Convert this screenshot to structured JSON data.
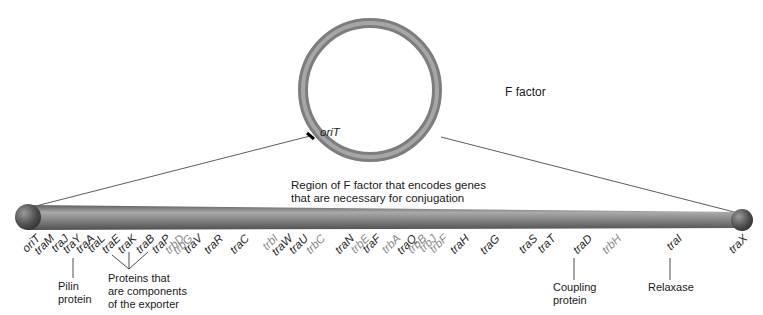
{
  "plasmid": {
    "name": "F factor",
    "origin_label": "oriT"
  },
  "region_caption": "Region of F factor that encodes genes that are necessary for conjugation",
  "region_caption_lines": [
    "Region of F factor that encodes genes",
    "that are necessary for conjugation"
  ],
  "genes": [
    {
      "name": "oriT",
      "x": 28,
      "type": "tra"
    },
    {
      "name": "traM",
      "x": 42,
      "type": "tra"
    },
    {
      "name": "traJ",
      "x": 56,
      "type": "tra"
    },
    {
      "name": "traY",
      "x": 69,
      "type": "tra"
    },
    {
      "name": "traA",
      "x": 82,
      "type": "tra"
    },
    {
      "name": "traL",
      "x": 93,
      "type": "tra"
    },
    {
      "name": "traE",
      "x": 108,
      "type": "tra"
    },
    {
      "name": "traK",
      "x": 124,
      "type": "tra"
    },
    {
      "name": "traB",
      "x": 142,
      "type": "tra"
    },
    {
      "name": "traP",
      "x": 158,
      "type": "tra"
    },
    {
      "name": "trbD",
      "x": 172,
      "type": "trb"
    },
    {
      "name": "trbG",
      "x": 180,
      "type": "trb"
    },
    {
      "name": "traV",
      "x": 190,
      "type": "tra"
    },
    {
      "name": "traR",
      "x": 211,
      "type": "tra"
    },
    {
      "name": "traC",
      "x": 237,
      "type": "tra"
    },
    {
      "name": "trbI",
      "x": 266,
      "type": "trb"
    },
    {
      "name": "traW",
      "x": 280,
      "type": "tra"
    },
    {
      "name": "traU",
      "x": 296,
      "type": "tra"
    },
    {
      "name": "trbC",
      "x": 313,
      "type": "trb"
    },
    {
      "name": "traN",
      "x": 342,
      "type": "tra"
    },
    {
      "name": "trbE",
      "x": 357,
      "type": "trb"
    },
    {
      "name": "traF",
      "x": 368,
      "type": "tra"
    },
    {
      "name": "trbA",
      "x": 388,
      "type": "trb"
    },
    {
      "name": "traQ",
      "x": 404,
      "type": "tra"
    },
    {
      "name": "trbB",
      "x": 414,
      "type": "trb"
    },
    {
      "name": "trbJ",
      "x": 424,
      "type": "trb"
    },
    {
      "name": "trbF",
      "x": 435,
      "type": "trb"
    },
    {
      "name": "traH",
      "x": 457,
      "type": "tra"
    },
    {
      "name": "traG",
      "x": 487,
      "type": "tra"
    },
    {
      "name": "traS",
      "x": 525,
      "type": "tra"
    },
    {
      "name": "traT",
      "x": 543,
      "type": "tra"
    },
    {
      "name": "traD",
      "x": 580,
      "type": "tra"
    },
    {
      "name": "trbH",
      "x": 609,
      "type": "trb"
    },
    {
      "name": "traI",
      "x": 670,
      "type": "tra"
    },
    {
      "name": "traX",
      "x": 735,
      "type": "tra"
    }
  ],
  "annotations": {
    "pilin": {
      "gene": "traA",
      "lines": [
        "Pilin",
        "protein"
      ]
    },
    "exporter": {
      "genes": [
        "traK",
        "traB",
        "traP"
      ],
      "lines": [
        "Proteins that",
        "are components",
        "of the exporter"
      ]
    },
    "coupling": {
      "gene": "traD",
      "lines": [
        "Coupling",
        "protein"
      ]
    },
    "relaxase": {
      "gene": "traI",
      "lines": [
        "Relaxase"
      ]
    }
  },
  "colors": {
    "plasmid_ring": "#8c8c8c",
    "rod": "#7a7a7a",
    "tra_label": "#1f1f1f",
    "trb_label": "#8a8a8a"
  }
}
